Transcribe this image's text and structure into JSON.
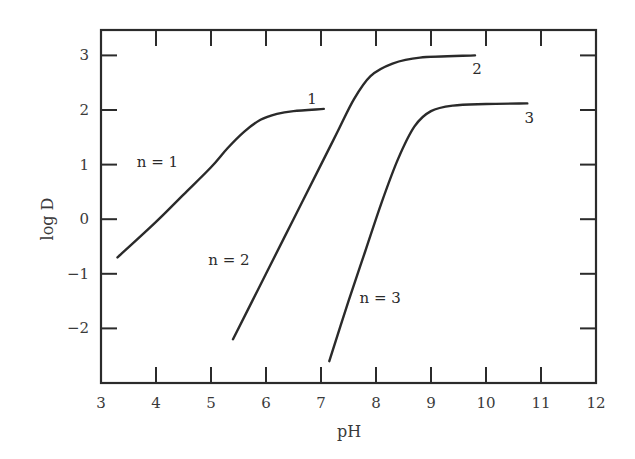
{
  "chart_data": {
    "type": "line",
    "title": "",
    "xlabel": "pH",
    "ylabel": "log D",
    "xlim": [
      3,
      12
    ],
    "ylim": [
      -3.0,
      3.45
    ],
    "grid": false,
    "legend": "none (curves labeled inline)",
    "x_ticks": [
      3,
      4,
      5,
      6,
      7,
      8,
      9,
      10,
      11,
      12
    ],
    "x_tick_labels": [
      "3",
      "4",
      "5",
      "6",
      "7",
      "8",
      "9",
      "10",
      "11",
      "12"
    ],
    "y_ticks": [
      3,
      2,
      1,
      0,
      -1,
      -2
    ],
    "y_tick_labels": [
      "3",
      "2",
      "1",
      "0",
      "−1",
      "−2"
    ],
    "series": [
      {
        "name": "1",
        "annotation": "n = 1",
        "x": [
          3.3,
          4.0,
          4.5,
          5.0,
          5.3,
          5.6,
          5.9,
          6.2,
          6.5,
          7.05
        ],
        "y": [
          -0.7,
          -0.05,
          0.45,
          0.95,
          1.3,
          1.6,
          1.82,
          1.93,
          1.98,
          2.02
        ]
      },
      {
        "name": "2",
        "annotation": "n = 2",
        "x": [
          5.4,
          6.0,
          6.5,
          7.0,
          7.3,
          7.6,
          7.9,
          8.3,
          8.8,
          9.8
        ],
        "y": [
          -2.2,
          -1.0,
          0.0,
          1.0,
          1.6,
          2.2,
          2.62,
          2.85,
          2.96,
          3.0
        ]
      },
      {
        "name": "3",
        "annotation": "n = 3",
        "x": [
          7.15,
          7.5,
          7.8,
          8.1,
          8.4,
          8.7,
          9.0,
          9.4,
          10.0,
          10.75
        ],
        "y": [
          -2.6,
          -1.5,
          -0.6,
          0.3,
          1.1,
          1.7,
          1.98,
          2.08,
          2.11,
          2.12
        ]
      }
    ],
    "annotations": [
      {
        "text": "n = 1",
        "x": 3.65,
        "y": 1.05
      },
      {
        "text": "n = 2",
        "x": 4.95,
        "y": -0.75
      },
      {
        "text": "n = 3",
        "x": 7.7,
        "y": -1.45
      },
      {
        "text": "1",
        "x": 6.75,
        "y": 2.2
      },
      {
        "text": "2",
        "x": 9.75,
        "y": 2.75
      },
      {
        "text": "3",
        "x": 10.7,
        "y": 1.85
      }
    ]
  }
}
